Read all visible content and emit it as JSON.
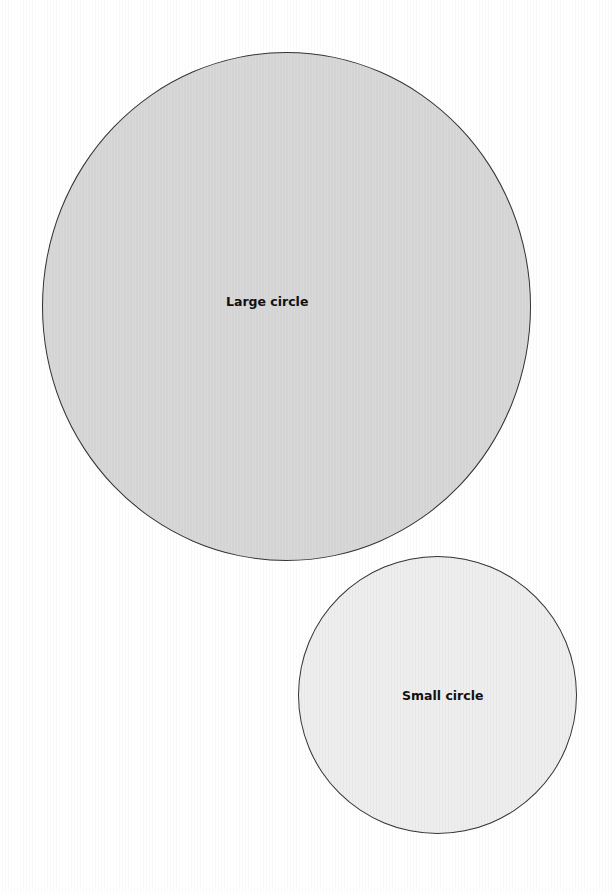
{
  "diagram": {
    "circles": [
      {
        "id": "large",
        "label": "Large circle",
        "fill": "#d4d4d4",
        "stroke": "#333333"
      },
      {
        "id": "small",
        "label": "Small circle",
        "fill": "#eeeeee",
        "stroke": "#333333"
      }
    ]
  }
}
